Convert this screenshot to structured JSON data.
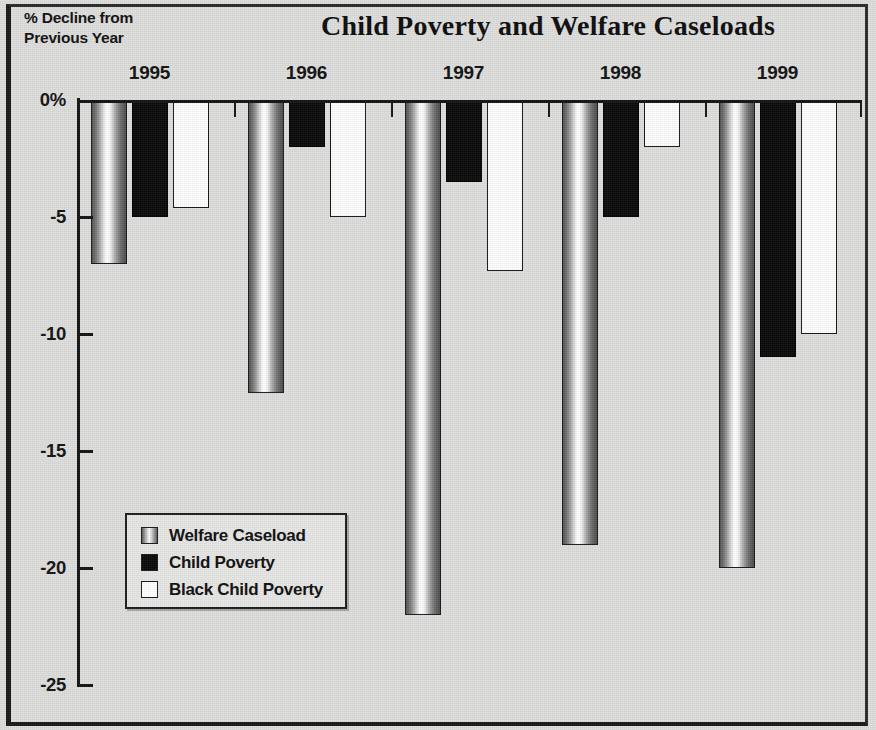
{
  "figure": {
    "title": "Child Poverty and Welfare Caseloads",
    "axis_caption_line1": "% Decline from",
    "axis_caption_line2": "Previous Year"
  },
  "legend": {
    "items": [
      {
        "label": "Welfare Caseload",
        "key": "welfare",
        "swatch": "gradient-gray",
        "color": "#9a9a9a"
      },
      {
        "label": "Child Poverty",
        "key": "poverty",
        "swatch": "solid-black",
        "color": "#0b0b0b"
      },
      {
        "label": "Black Child Poverty",
        "key": "black_poverty",
        "swatch": "solid-white",
        "color": "#ffffff"
      }
    ]
  },
  "chart_data": {
    "type": "bar",
    "title": "Child Poverty and Welfare Caseloads",
    "xlabel": "",
    "ylabel": "% Decline from Previous Year",
    "categories": [
      "1995",
      "1996",
      "1997",
      "1998",
      "1999"
    ],
    "ylim": [
      -25,
      0
    ],
    "ytick_labels": [
      "0%",
      "-5",
      "-10",
      "-15",
      "-20",
      "-25"
    ],
    "ytick_values": [
      0,
      -5,
      -10,
      -15,
      -20,
      -25
    ],
    "grid": false,
    "legend_position": "inside-lower-left",
    "series": [
      {
        "name": "Welfare Caseload",
        "color": "#9a9a9a",
        "values": [
          -7.0,
          -12.5,
          -22.0,
          -19.0,
          -20.0
        ]
      },
      {
        "name": "Child Poverty",
        "color": "#0b0b0b",
        "values": [
          -5.0,
          -2.0,
          -3.5,
          -5.0,
          -11.0
        ]
      },
      {
        "name": "Black Child Poverty",
        "color": "#ffffff",
        "values": [
          -4.6,
          -5.0,
          -7.3,
          -2.0,
          -10.0
        ]
      }
    ]
  }
}
